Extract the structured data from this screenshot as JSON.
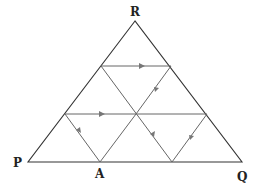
{
  "diagram": {
    "type": "equilateral triangle subdivided into 9 small triangles with a reflected light path",
    "vertices": {
      "R": {
        "label": "R",
        "x": 135,
        "y": 21
      },
      "P": {
        "label": "P",
        "x": 28,
        "y": 162
      },
      "Q": {
        "label": "Q",
        "x": 242,
        "y": 162
      },
      "A": {
        "label": "A",
        "x": 100,
        "y": 162
      }
    },
    "labels": [
      {
        "id": "R",
        "text": "R",
        "x": 130,
        "y": 16
      },
      {
        "id": "P",
        "text": "P",
        "x": 13,
        "y": 167
      },
      {
        "id": "A",
        "text": "A",
        "x": 95,
        "y": 178
      },
      {
        "id": "Q",
        "text": "Q",
        "x": 237,
        "y": 181
      }
    ],
    "path_segments": [
      {
        "from": [
          100,
          162
        ],
        "to": [
          65,
          114
        ],
        "arrow": "toward-end"
      },
      {
        "from": [
          65,
          114
        ],
        "to": [
          136,
          114
        ],
        "arrow": "toward-end"
      },
      {
        "from": [
          136,
          114
        ],
        "to": [
          207,
          114
        ],
        "arrow": "none"
      },
      {
        "from": [
          207,
          114
        ],
        "to": [
          172,
          162
        ],
        "arrow": "toward-end"
      },
      {
        "from": [
          172,
          162
        ],
        "to": [
          136,
          114
        ],
        "arrow": "toward-end"
      },
      {
        "from": [
          136,
          114
        ],
        "to": [
          101,
          66
        ],
        "arrow": "none"
      },
      {
        "from": [
          101,
          66
        ],
        "to": [
          171,
          66
        ],
        "arrow": "toward-end"
      },
      {
        "from": [
          171,
          66
        ],
        "to": [
          136,
          114
        ],
        "arrow": "toward-end"
      },
      {
        "from": [
          136,
          114
        ],
        "to": [
          100,
          162
        ],
        "arrow": "none"
      }
    ],
    "colors": {
      "outline": "#333333",
      "path": "#666666",
      "arrow": "#777777",
      "background": "#ffffff"
    }
  }
}
